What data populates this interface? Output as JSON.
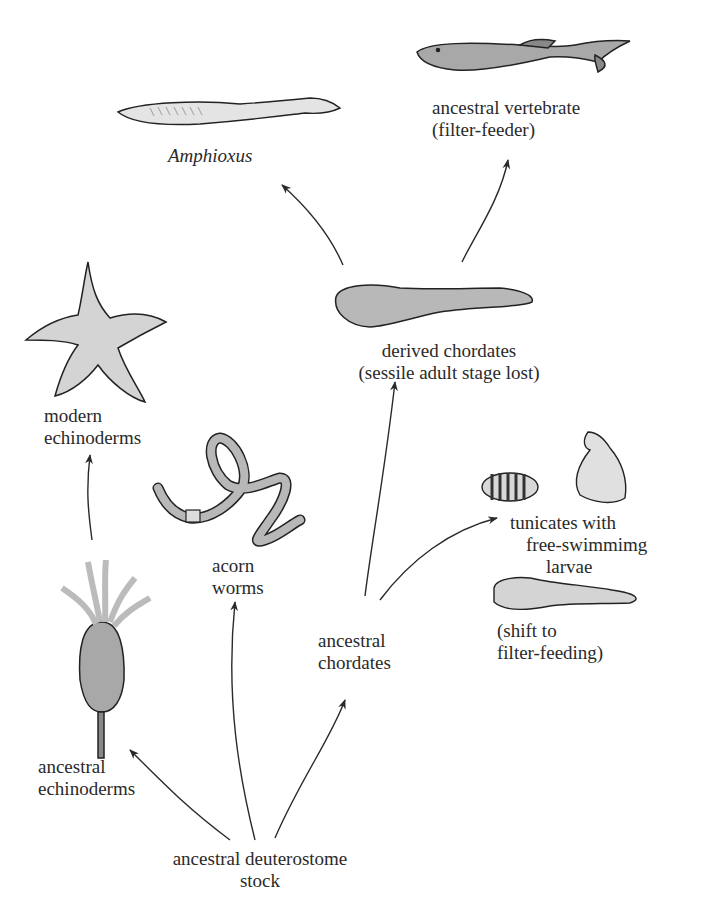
{
  "diagram": {
    "type": "evolutionary-tree",
    "root": {
      "label_line1": "ancestral deuterostome",
      "label_line2": "stock"
    },
    "nodes": {
      "ancestral_echinoderms": {
        "line1": "ancestral",
        "line2": "echinoderms"
      },
      "modern_echinoderms": {
        "line1": "modern",
        "line2": "echinoderms"
      },
      "acorn_worms": {
        "line1": "acorn",
        "line2": "worms"
      },
      "ancestral_chordates": {
        "line1": "ancestral",
        "line2": "chordates"
      },
      "tunicates": {
        "line1": "tunicates with",
        "line2": "free-swimmimg",
        "line3": "larvae"
      },
      "tunicate_shift": {
        "line1": "(shift to",
        "line2": "filter-feeding)"
      },
      "derived_chordates": {
        "line1": "derived chordates",
        "line2": "(sessile adult stage lost)"
      },
      "amphioxus": {
        "label": "Amphioxus"
      },
      "ancestral_vertebrate": {
        "line1": "ancestral vertebrate",
        "line2": "(filter-feeder)"
      }
    },
    "edges": [
      {
        "from": "ancestral deuterostome stock",
        "to": "ancestral echinoderms"
      },
      {
        "from": "ancestral deuterostome stock",
        "to": "acorn worms"
      },
      {
        "from": "ancestral deuterostome stock",
        "to": "ancestral chordates"
      },
      {
        "from": "ancestral echinoderms",
        "to": "modern echinoderms"
      },
      {
        "from": "ancestral chordates",
        "to": "tunicates with free-swimmimg larvae"
      },
      {
        "from": "ancestral chordates",
        "to": "derived chordates"
      },
      {
        "from": "derived chordates",
        "to": "Amphioxus"
      },
      {
        "from": "derived chordates",
        "to": "ancestral vertebrate"
      }
    ],
    "colors": {
      "ink": "#2a2a2a",
      "fill": "#b8b8b8",
      "fill_light": "#d8d8d8"
    }
  }
}
